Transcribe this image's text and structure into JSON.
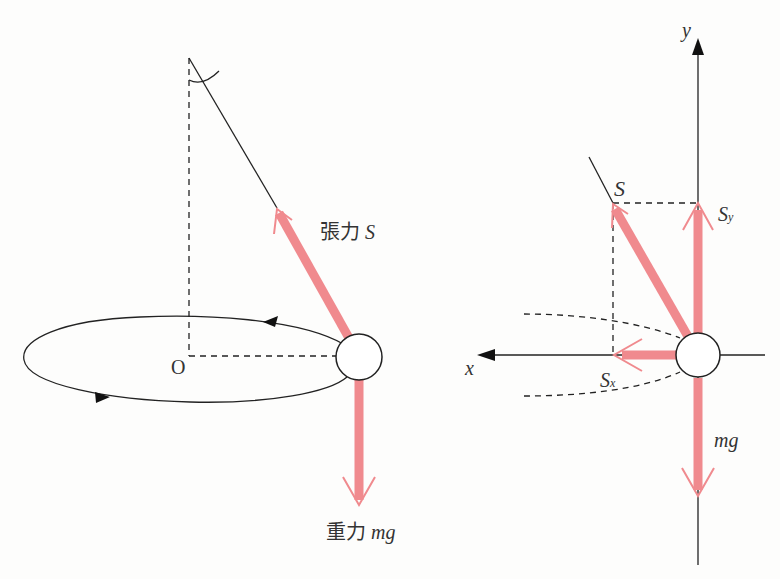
{
  "colors": {
    "force": "#f08a8e",
    "line": "#222222",
    "background": "#fdfdfc"
  },
  "left_figure": {
    "origin_label": "O",
    "tension_label_prefix": "張力",
    "tension_symbol": "S",
    "gravity_label_prefix": "重力",
    "gravity_symbol": "mg"
  },
  "right_figure": {
    "y_axis_label": "y",
    "x_axis_label": "x",
    "tension_symbol": "S",
    "sy_main": "S",
    "sy_sub": "y",
    "sx_main": "S",
    "sx_sub": "x",
    "gravity_symbol": "mg"
  }
}
